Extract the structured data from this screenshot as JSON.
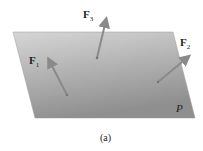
{
  "figure": {
    "caption": "(a)",
    "plane_label": "P",
    "forces": [
      {
        "symbol": "F",
        "subscript": "1"
      },
      {
        "symbol": "F",
        "subscript": "2"
      },
      {
        "symbol": "F",
        "subscript": "3"
      }
    ],
    "colors": {
      "plane_light": "#d4d4d4",
      "plane_dark": "#8a8a8a",
      "arrow": "#8a8a8a"
    }
  }
}
